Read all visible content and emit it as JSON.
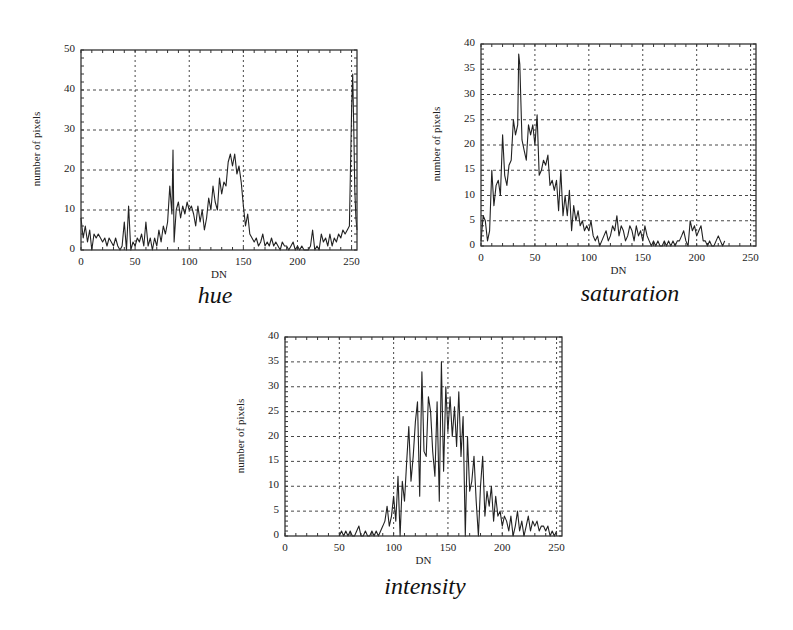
{
  "chart_data": [
    {
      "type": "line",
      "title": "",
      "caption": "hue",
      "xlabel": "DN",
      "ylabel": "number of pixels",
      "xlim": [
        0,
        255
      ],
      "ylim": [
        0,
        50
      ],
      "xticks": [
        0,
        50,
        100,
        150,
        200,
        250
      ],
      "yticks": [
        0,
        10,
        20,
        30,
        40,
        50
      ],
      "grid": true,
      "legend": null,
      "x": [
        0,
        2,
        4,
        6,
        8,
        10,
        12,
        14,
        16,
        18,
        20,
        22,
        24,
        26,
        28,
        30,
        32,
        34,
        36,
        38,
        40,
        42,
        44,
        46,
        48,
        50,
        52,
        54,
        56,
        58,
        60,
        62,
        64,
        66,
        68,
        70,
        72,
        74,
        76,
        78,
        80,
        82,
        84,
        85,
        86,
        88,
        90,
        92,
        94,
        96,
        98,
        100,
        102,
        104,
        106,
        108,
        110,
        112,
        114,
        116,
        118,
        120,
        122,
        124,
        126,
        128,
        130,
        132,
        134,
        136,
        138,
        140,
        142,
        144,
        146,
        148,
        150,
        152,
        154,
        156,
        158,
        160,
        162,
        164,
        166,
        168,
        170,
        172,
        174,
        176,
        178,
        180,
        182,
        184,
        186,
        188,
        190,
        192,
        194,
        196,
        198,
        200,
        202,
        204,
        206,
        208,
        210,
        212,
        214,
        216,
        218,
        220,
        222,
        224,
        226,
        228,
        230,
        232,
        234,
        236,
        238,
        240,
        242,
        244,
        246,
        248,
        250,
        251,
        252,
        253,
        254,
        255
      ],
      "values": [
        8,
        3,
        6,
        2,
        5,
        0,
        4,
        3,
        4,
        3,
        2,
        3,
        1,
        3,
        2,
        1,
        3,
        1,
        0,
        1,
        7,
        0,
        11,
        0,
        2,
        1,
        3,
        2,
        4,
        1,
        7,
        1,
        3,
        0,
        3,
        1,
        5,
        2,
        6,
        4,
        7,
        16,
        9,
        25,
        2,
        10,
        12,
        8,
        11,
        9,
        12,
        10,
        11,
        9,
        6,
        11,
        7,
        10,
        5,
        8,
        13,
        10,
        16,
        12,
        10,
        18,
        14,
        17,
        16,
        22,
        24,
        21,
        24,
        19,
        21,
        17,
        11,
        6,
        9,
        4,
        3,
        2,
        3,
        1,
        2,
        4,
        1,
        2,
        1,
        3,
        1,
        2,
        1,
        0,
        2,
        1,
        1,
        0,
        1,
        2,
        0,
        1,
        0,
        1,
        0,
        0,
        0,
        1,
        5,
        0,
        1,
        0,
        4,
        2,
        3,
        1,
        4,
        1,
        3,
        2,
        4,
        3,
        5,
        4,
        5,
        6,
        35,
        44,
        30,
        15,
        8,
        5
      ],
      "frame_px": {
        "left": 81,
        "top": 50,
        "right": 357,
        "bottom": 250
      }
    },
    {
      "type": "line",
      "title": "",
      "caption": "saturation",
      "xlabel": "DN",
      "ylabel": "number of pixels",
      "xlim": [
        0,
        255
      ],
      "ylim": [
        0,
        40
      ],
      "xticks": [
        0,
        50,
        100,
        150,
        200,
        250
      ],
      "yticks": [
        0,
        5,
        10,
        15,
        20,
        25,
        30,
        35,
        40
      ],
      "grid": true,
      "legend": null,
      "x": [
        0,
        2,
        4,
        6,
        8,
        10,
        12,
        14,
        16,
        18,
        20,
        22,
        24,
        26,
        28,
        30,
        32,
        34,
        35,
        36,
        38,
        40,
        42,
        44,
        46,
        48,
        50,
        52,
        54,
        56,
        58,
        60,
        62,
        64,
        66,
        68,
        70,
        72,
        74,
        76,
        78,
        80,
        82,
        84,
        86,
        88,
        90,
        92,
        94,
        96,
        98,
        100,
        102,
        104,
        106,
        108,
        110,
        112,
        114,
        116,
        118,
        120,
        122,
        124,
        126,
        128,
        130,
        132,
        134,
        136,
        138,
        140,
        142,
        144,
        146,
        148,
        150,
        152,
        154,
        156,
        158,
        160,
        162,
        164,
        166,
        168,
        170,
        172,
        174,
        176,
        178,
        180,
        182,
        184,
        186,
        188,
        190,
        192,
        194,
        196,
        198,
        200,
        202,
        204,
        206,
        208,
        210,
        212,
        214,
        216,
        218,
        220,
        222,
        224,
        226
      ],
      "values": [
        1,
        6,
        5,
        1,
        3,
        15,
        8,
        12,
        13,
        10,
        22,
        14,
        12,
        16,
        17,
        25,
        22,
        24,
        38,
        36,
        21,
        19,
        17,
        24,
        22,
        24,
        20,
        26,
        14,
        15,
        17,
        16,
        18,
        12,
        13,
        11,
        13,
        7,
        15,
        6,
        10,
        6,
        11,
        3,
        8,
        5,
        7,
        4,
        5,
        3,
        4,
        3,
        5,
        2,
        1,
        2,
        0,
        1,
        2,
        3,
        1,
        2,
        4,
        3,
        6,
        2,
        4,
        3,
        1,
        2,
        4,
        3,
        1,
        4,
        2,
        3,
        1,
        4,
        2,
        1,
        0,
        1,
        0,
        1,
        0,
        0,
        1,
        0,
        1,
        0,
        1,
        0,
        1,
        1,
        2,
        3,
        1,
        0,
        5,
        3,
        4,
        2,
        3,
        4,
        1,
        1,
        0,
        1,
        0,
        0,
        1,
        2,
        1,
        0,
        1,
        2
      ],
      "frame_px": {
        "left": 481,
        "top": 44,
        "right": 756,
        "bottom": 246
      }
    },
    {
      "type": "line",
      "title": "",
      "caption": "intensity",
      "xlabel": "DN",
      "ylabel": "number of pixels",
      "xlim": [
        0,
        255
      ],
      "ylim": [
        0,
        40
      ],
      "xticks": [
        0,
        50,
        100,
        150,
        200,
        250
      ],
      "yticks": [
        0,
        5,
        10,
        15,
        20,
        25,
        30,
        35,
        40
      ],
      "grid": true,
      "legend": null,
      "x": [
        50,
        52,
        54,
        56,
        58,
        60,
        62,
        64,
        66,
        68,
        70,
        72,
        74,
        76,
        78,
        80,
        82,
        84,
        86,
        88,
        90,
        92,
        94,
        96,
        98,
        100,
        102,
        104,
        106,
        108,
        110,
        112,
        114,
        116,
        118,
        120,
        122,
        124,
        126,
        128,
        130,
        132,
        134,
        136,
        138,
        140,
        142,
        144,
        146,
        148,
        150,
        152,
        154,
        156,
        158,
        160,
        162,
        164,
        166,
        168,
        170,
        172,
        174,
        176,
        178,
        180,
        182,
        184,
        186,
        188,
        190,
        192,
        194,
        196,
        198,
        200,
        202,
        204,
        206,
        208,
        210,
        212,
        214,
        216,
        218,
        220,
        222,
        224,
        226,
        228,
        230,
        232,
        234,
        236,
        238,
        240,
        242,
        244,
        246,
        248,
        250
      ],
      "values": [
        0,
        1,
        0,
        1,
        0,
        1,
        0,
        0,
        1,
        2,
        0,
        0,
        1,
        0,
        0,
        1,
        0,
        1,
        0,
        1,
        2,
        3,
        6,
        2,
        4,
        8,
        3,
        12,
        0,
        11,
        7,
        15,
        22,
        11,
        16,
        23,
        27,
        8,
        33,
        17,
        16,
        28,
        25,
        17,
        12,
        27,
        7,
        35,
        13,
        30,
        21,
        28,
        20,
        26,
        18,
        29,
        16,
        24,
        0,
        20,
        9,
        11,
        16,
        7,
        0,
        10,
        16,
        4,
        9,
        6,
        10,
        3,
        8,
        4,
        5,
        2,
        4,
        3,
        1,
        4,
        0,
        2,
        5,
        1,
        3,
        0,
        2,
        4,
        1,
        3,
        2,
        3,
        1,
        2,
        2,
        1,
        2,
        0,
        1,
        0,
        1
      ],
      "frame_px": {
        "left": 285,
        "top": 337,
        "right": 562,
        "bottom": 536
      }
    }
  ],
  "charts": [
    {
      "caption": "hue",
      "xlabel": "DN",
      "ylabel": "number of pixels",
      "xticks": [
        "0",
        "50",
        "100",
        "150",
        "200",
        "250"
      ],
      "yticks": [
        "0",
        "10",
        "20",
        "30",
        "40",
        "50"
      ]
    },
    {
      "caption": "saturation",
      "xlabel": "DN",
      "ylabel": "number of pixels",
      "xticks": [
        "0",
        "50",
        "100",
        "150",
        "200",
        "250"
      ],
      "yticks": [
        "0",
        "5",
        "10",
        "15",
        "20",
        "25",
        "30",
        "35",
        "40"
      ]
    },
    {
      "caption": "intensity",
      "xlabel": "DN",
      "ylabel": "number of pixels",
      "xticks": [
        "0",
        "50",
        "100",
        "150",
        "200",
        "250"
      ],
      "yticks": [
        "0",
        "5",
        "10",
        "15",
        "20",
        "25",
        "30",
        "35",
        "40"
      ]
    }
  ],
  "colors": {
    "line": "#222222",
    "grid": "#333333",
    "frame": "#333333",
    "background": "#ffffff"
  }
}
